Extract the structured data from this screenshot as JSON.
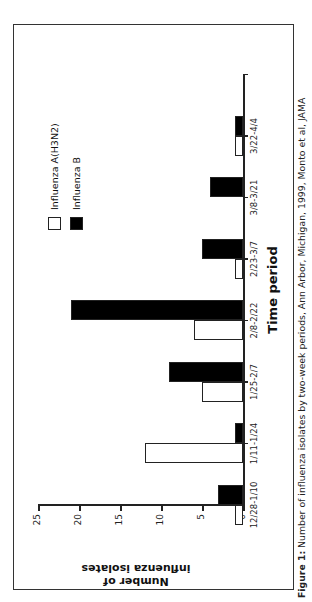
{
  "chart_data": {
    "type": "bar",
    "orientation": "vertical bars, figure rotated 90 degrees counter-clockwise on the page",
    "title": "",
    "xlabel": "Time period",
    "ylabel": "Number of influenza isolates",
    "ylim": [
      0,
      25
    ],
    "yticks": [
      0,
      5,
      10,
      15,
      20,
      25
    ],
    "grid": false,
    "legend_position": "upper right (inside plot)",
    "categories": [
      "12/28-1/10",
      "1/11-1/24",
      "1/25-2/7",
      "2/8-2/22",
      "2/23-3/7",
      "3/8-3/21",
      "3/22-4/4"
    ],
    "series": [
      {
        "name": "Influenza A(H3N2)",
        "color": "#ffffff",
        "edge": "#000000",
        "values": [
          1,
          12,
          5,
          6,
          1,
          0,
          1
        ]
      },
      {
        "name": "Influenza B",
        "color": "#000000",
        "edge": "#000000",
        "values": [
          3,
          1,
          9,
          21,
          5,
          4,
          1
        ]
      }
    ]
  },
  "axis": {
    "ytitle_line1": "Number of",
    "ytitle_line2": "influenza isolates",
    "xtitle": "Time period",
    "yticks": [
      "0",
      "5",
      "10",
      "15",
      "20",
      "25"
    ],
    "xticks": [
      "12/28-1/10",
      "1/11-1/24",
      "1/25-2/7",
      "2/8-2/22",
      "2/23-3/7",
      "3/8-3/21",
      "3/22-4/4"
    ]
  },
  "legend": {
    "a": "Influenza A(H3N2)",
    "b": "Influenza B"
  },
  "caption": {
    "label": "Figure 1:",
    "text": " Number of influenza isolates by two-week periods, Ann Arbor, Michigan, 1999, Monto et al, JAMA"
  }
}
